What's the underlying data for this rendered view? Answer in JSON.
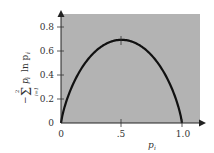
{
  "chart_data": {
    "type": "line",
    "title": "",
    "xlabel": "p_i",
    "ylabel": "-Σ_{i=1}^{2} p_i ln p_i",
    "xlim": [
      0,
      1.0
    ],
    "ylim": [
      0,
      0.9
    ],
    "x_ticks": [
      "0",
      ".5",
      "1.0"
    ],
    "y_ticks": [
      "0",
      "0.2",
      "0.4",
      "0.6",
      "0.8"
    ],
    "grid": false,
    "background": "#b3b3b3",
    "series": [
      {
        "name": "binary entropy",
        "color": "#111111",
        "x": [
          0,
          0.05,
          0.1,
          0.2,
          0.3,
          0.4,
          0.5,
          0.6,
          0.7,
          0.8,
          0.9,
          0.95,
          1.0
        ],
        "y": [
          0,
          0.199,
          0.325,
          0.5,
          0.611,
          0.673,
          0.693,
          0.673,
          0.611,
          0.5,
          0.325,
          0.199,
          0
        ]
      }
    ],
    "annotations": [
      {
        "type": "tick-mark",
        "x": 0.5,
        "y": 0.693
      }
    ]
  },
  "labels": {
    "x0": "0",
    "x5": ".5",
    "x10": "1.0",
    "y0": "0",
    "y2": "0.2",
    "y4": "0.4",
    "y6": "0.6",
    "y8": "0.8",
    "xlabel_main": "p",
    "xlabel_sub": "i",
    "ylabel_minus": "−",
    "ylabel_sigma": "Σ",
    "ylabel_upper": "2",
    "ylabel_lower": "i=1",
    "ylabel_rest": "p",
    "ylabel_rest_sub": "i",
    "ylabel_ln": "ln p",
    "ylabel_ln_sub": "i"
  }
}
